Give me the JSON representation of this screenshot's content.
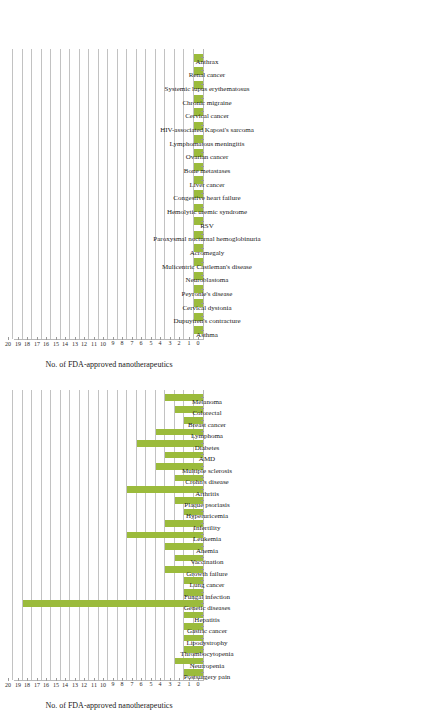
{
  "figure": {
    "axis_title": "No. of FDA-approved nanotherapeutics",
    "bar_color": "#9BBB3C",
    "gridline_color": "#c2c2c2",
    "axis_color": "#b8b8b8",
    "ticks": [
      "0",
      "1",
      "2",
      "3",
      "4",
      "5",
      "6",
      "7",
      "8",
      "9",
      "10",
      "11",
      "12",
      "13",
      "14",
      "15",
      "16",
      "17",
      "18",
      "19",
      "20"
    ]
  },
  "chart_data": [
    {
      "type": "bar",
      "id": "top-chart",
      "title": "",
      "orientation": "rotated-90",
      "xlabel": "",
      "ylabel": "No. of FDA-approved nanotherapeutics",
      "ylim": [
        0,
        20
      ],
      "grid": true,
      "legend": "none",
      "categories": [
        "Asthma",
        "Neutropenia",
        "Dupuytren's contracture",
        "Cervical dystonia",
        "Lipodystrophy",
        "Peyronie's disease",
        "Neuroblastoma",
        "Hepatitis",
        "Mulicentric Castleman's disease",
        "Fungal infection",
        "Acromegaly",
        "Lung cancer",
        "Paroxysmal nocturnal hemoglobinuria",
        "Growth failure",
        "RSV",
        "Vaccination",
        "Hemolytic uremic syndrome",
        "Anemia",
        "Congestive heart failure",
        "Leukemia",
        "Liver cancer",
        "Infertility",
        "Bone metastases",
        "Hyperuricemia",
        "Ovarian cancer",
        "Plaque psoriasis",
        "Lymphomatous meningitis",
        "Arthritis",
        "HIV-associated Kaposi's sarcoma",
        "Crohn's disease",
        "Cervical cancer",
        "Multiple sclerosis",
        "Chronic migraine",
        "AMD",
        "Systemic lupus erythematosus",
        "Diabetes",
        "Renal cancer",
        "Lymphoma",
        "Anthrax"
      ],
      "visible_categories": [
        "Asthma",
        "Dupuytren's contracture",
        "Cervical dystonia",
        "Peyronie's disease",
        "Neuroblastoma",
        "Mulicentric Castleman's disease",
        "Acromegaly",
        "Paroxysmal nocturnal hemoglobinuria",
        "RSV",
        "Hemolytic uremic syndrome",
        "Congestive heart failure",
        "Liver cancer",
        "Bone metastases",
        "Ovarian cancer",
        "Lymphomatous meningitis",
        "HIV-associated Kaposi's sarcoma",
        "Cervical cancer",
        "Chronic migraine",
        "Systemic lupus erythematosus",
        "Renal cancer",
        "Anthrax"
      ],
      "values": [
        1,
        1,
        1,
        1,
        1,
        1,
        1,
        1,
        1,
        1,
        1,
        1,
        1,
        1,
        1,
        1,
        1,
        1,
        1,
        1,
        1
      ]
    },
    {
      "type": "bar",
      "id": "bottom-chart",
      "title": "",
      "orientation": "rotated-90",
      "xlabel": "",
      "ylabel": "No. of FDA-approved nanotherapeutics",
      "ylim": [
        0,
        20
      ],
      "grid": true,
      "legend": "none",
      "categories": [
        "Postsurgery pain",
        "Neutropenia",
        "Thrombocytopenia",
        "Lipodystrophy",
        "Gastric cancer",
        "Hepatitis",
        "Genetic diseases",
        "Fungal infection",
        "Lung cancer",
        "Growth failure",
        "Vaccination",
        "Anemia",
        "Leukemia",
        "Infertility",
        "Hyperuricemia",
        "Plaque psoriasis",
        "Arthritis",
        "Crohn's disease",
        "Multiple sclerosis",
        "AMD",
        "Diabetes",
        "Lymphoma",
        "Breast cancer",
        "Colorectal",
        "Melanoma"
      ],
      "values": [
        2,
        3,
        2,
        2,
        2,
        2,
        19,
        2,
        2,
        4,
        3,
        4,
        8,
        4,
        2,
        3,
        8,
        3,
        5,
        4,
        7,
        5,
        2,
        3,
        4
      ]
    }
  ]
}
